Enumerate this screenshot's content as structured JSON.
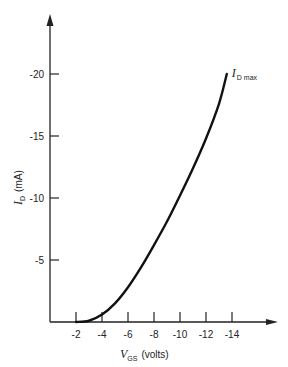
{
  "chart_data": {
    "type": "line",
    "title": "",
    "xlabel": "V_GS (volts)",
    "xlabel_main": "V",
    "xlabel_sub": "GS",
    "xlabel_unit": "(volts)",
    "ylabel": "I_D (mA)",
    "ylabel_main": "I",
    "ylabel_sub": "D",
    "ylabel_unit": "(mA)",
    "x_ticks": [
      -2,
      -4,
      -6,
      -8,
      -10,
      -12,
      -14
    ],
    "x_tick_labels": [
      "-2",
      "-4",
      "-6",
      "-8",
      "-10",
      "-12",
      "-14"
    ],
    "y_ticks": [
      -5,
      -10,
      -15,
      -20
    ],
    "y_tick_labels": [
      "-5",
      "-10",
      "-15",
      "-20"
    ],
    "xlim": [
      0,
      -17
    ],
    "ylim": [
      0,
      -24
    ],
    "grid": false,
    "series": [
      {
        "name": "I_D vs V_GS",
        "x": [
          -2.0,
          -3.0,
          -4.0,
          -5.0,
          -6.0,
          -7.0,
          -8.0,
          -9.0,
          -10.0,
          -11.0,
          -12.0,
          -13.0,
          -13.6
        ],
        "y": [
          0.0,
          -0.1,
          -0.6,
          -1.5,
          -2.8,
          -4.4,
          -6.2,
          -8.1,
          -10.2,
          -12.4,
          -14.8,
          -17.6,
          -20.0
        ]
      }
    ],
    "annotations": [
      {
        "text": "I_D max",
        "main": "I",
        "sub": "D max",
        "x": -13.6,
        "y": -20.0
      }
    ]
  }
}
